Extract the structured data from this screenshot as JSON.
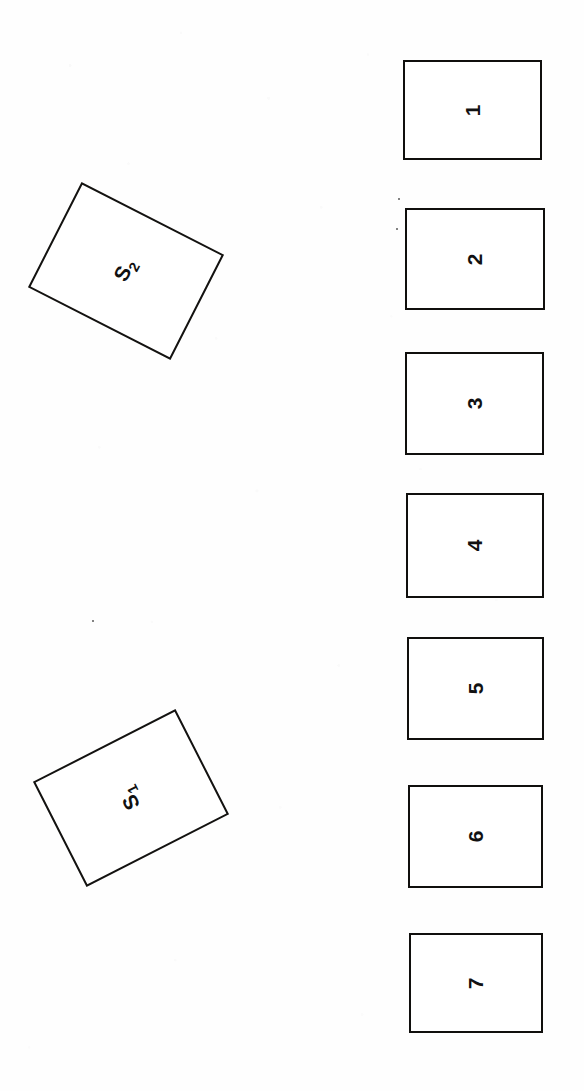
{
  "figure": {
    "background_color": "#fefefe",
    "ink_color": "#111111",
    "orientation_note": "sideways",
    "panels": [
      {
        "label": "1",
        "left": 403,
        "top": 60,
        "width": 139,
        "height": 100
      },
      {
        "label": "2",
        "top": 208,
        "left": 405,
        "width": 140,
        "height": 102
      },
      {
        "label": "3",
        "top": 352,
        "left": 405,
        "width": 139,
        "height": 103
      },
      {
        "label": "4",
        "top": 493,
        "left": 406,
        "width": 138,
        "height": 105
      },
      {
        "label": "5",
        "top": 637,
        "left": 407,
        "width": 137,
        "height": 103
      },
      {
        "label": "6",
        "top": 785,
        "left": 408,
        "width": 135,
        "height": 103
      },
      {
        "label": "7",
        "top": 933,
        "left": 409,
        "width": 134,
        "height": 100
      }
    ],
    "tilted_panels": [
      {
        "label_base": "S",
        "label_sub": "2",
        "left": 46,
        "top": 212,
        "width": 160,
        "height": 118,
        "rotation_deg": 27,
        "label_rotation_deg": -90
      },
      {
        "label_base": "S",
        "label_sub": "1",
        "left": 51,
        "top": 739,
        "width": 160,
        "height": 118,
        "rotation_deg": -27,
        "label_rotation_deg": -90
      }
    ],
    "specks": [
      {
        "left": 92,
        "top": 620
      },
      {
        "left": 398,
        "top": 198
      },
      {
        "left": 396,
        "top": 228
      }
    ]
  }
}
